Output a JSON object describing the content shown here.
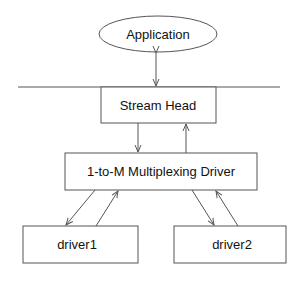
{
  "diagram": {
    "nodes": [
      {
        "id": "application",
        "label": "Application",
        "shape": "ellipse"
      },
      {
        "id": "stream_head",
        "label": "Stream Head",
        "shape": "rect"
      },
      {
        "id": "mux_driver",
        "label": "1-to-M Multiplexing Driver",
        "shape": "rect"
      },
      {
        "id": "driver1",
        "label": "driver1",
        "shape": "rect"
      },
      {
        "id": "driver2",
        "label": "driver2",
        "shape": "rect"
      }
    ],
    "edges": [
      {
        "from": "application",
        "to": "stream_head",
        "type": "bidirectional"
      },
      {
        "from": "stream_head",
        "to": "mux_driver",
        "type": "down"
      },
      {
        "from": "mux_driver",
        "to": "stream_head",
        "type": "up"
      },
      {
        "from": "mux_driver",
        "to": "driver1",
        "type": "down"
      },
      {
        "from": "driver1",
        "to": "mux_driver",
        "type": "up"
      },
      {
        "from": "mux_driver",
        "to": "driver2",
        "type": "down"
      },
      {
        "from": "driver2",
        "to": "mux_driver",
        "type": "up"
      }
    ],
    "boundary_line": "user/kernel boundary"
  }
}
